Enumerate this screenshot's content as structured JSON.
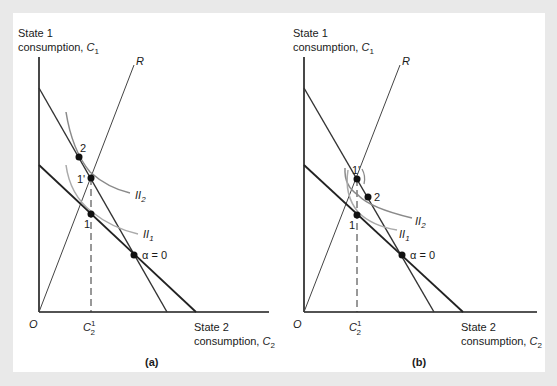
{
  "figure": {
    "background": "#e9e9e9",
    "panel_background": "#ffffff",
    "colors": {
      "axis": "#1a1a1a",
      "budget_line": "#333333",
      "ray": "#444444",
      "indifference_curve": "#8a8a8a",
      "point": "#111111"
    }
  },
  "panels": [
    {
      "id": "a",
      "caption": "(a)",
      "y_axis_label_line1": "State 1",
      "y_axis_label_line2": "consumption, ",
      "y_axis_var": "C",
      "y_axis_sub": "1",
      "x_axis_label_line1": "State 2",
      "x_axis_label_line2": "consumption, ",
      "x_axis_var": "C",
      "x_axis_sub": "2",
      "origin_label": "O",
      "ray_label": "R",
      "tick_label_var": "C",
      "tick_label_sub": "2",
      "tick_label_sup": "1",
      "points": {
        "p2": "2",
        "p1prime": "1'",
        "p1": "1",
        "alpha0": "α = 0"
      },
      "curves": {
        "ii2_var": "II",
        "ii2_sub": "2",
        "ii1_var": "II",
        "ii1_sub": "1"
      }
    },
    {
      "id": "b",
      "caption": "(b)",
      "y_axis_label_line1": "State 1",
      "y_axis_label_line2": "consumption, ",
      "y_axis_var": "C",
      "y_axis_sub": "1",
      "x_axis_label_line1": "State 2",
      "x_axis_label_line2": "consumption, ",
      "x_axis_var": "C",
      "x_axis_sub": "2",
      "origin_label": "O",
      "ray_label": "R",
      "tick_label_var": "C",
      "tick_label_sub": "2",
      "tick_label_sup": "1",
      "points": {
        "p2": "2",
        "p1prime": "1'",
        "p1": "1",
        "alpha0": "α = 0"
      },
      "curves": {
        "ii2_var": "II",
        "ii2_sub": "2",
        "ii1_var": "II",
        "ii1_sub": "1"
      }
    }
  ]
}
